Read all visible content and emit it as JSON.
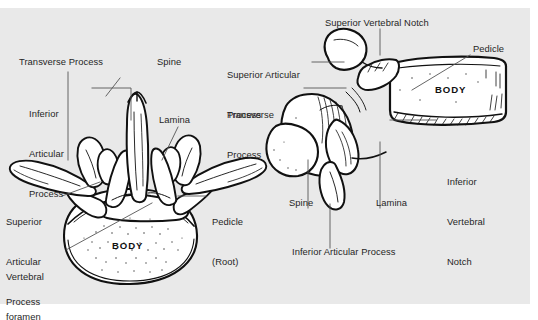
{
  "figure": {
    "background_color": "#e9e9e9",
    "ink_color": "#111111",
    "label_color": "#262626",
    "leader_color": "#555555"
  },
  "superior_view": {
    "body_label": "BODY",
    "labels": [
      {
        "id": "transverse-process",
        "text": "Transverse Process"
      },
      {
        "id": "inferior-articular-process-l1",
        "text": "Inferior"
      },
      {
        "id": "inferior-articular-process-l2",
        "text": "Articular"
      },
      {
        "id": "inferior-articular-process-l3",
        "text": "Process"
      },
      {
        "id": "spine",
        "text": "Spine"
      },
      {
        "id": "lamina",
        "text": "Lamina"
      },
      {
        "id": "superior-articular-process-l1",
        "text": "Superior"
      },
      {
        "id": "superior-articular-process-l2",
        "text": "Articular"
      },
      {
        "id": "superior-articular-process-l3",
        "text": "Process"
      },
      {
        "id": "pedicle-l1",
        "text": "Pedicle"
      },
      {
        "id": "pedicle-l2",
        "text": "(Root)"
      },
      {
        "id": "vertebral-foramen-l1",
        "text": "Vertebral"
      },
      {
        "id": "vertebral-foramen-l2",
        "text": "foramen"
      }
    ]
  },
  "lateral_view": {
    "body_label": "BODY",
    "labels": [
      {
        "id": "superior-vertebral-notch",
        "text": "Superior Vertebral Notch"
      },
      {
        "id": "superior-articular-process-l1",
        "text": "Superior Articular"
      },
      {
        "id": "superior-articular-process-l2",
        "text": "Process"
      },
      {
        "id": "pedicle",
        "text": "Pedicle"
      },
      {
        "id": "transverse-process-l1",
        "text": "Transverse"
      },
      {
        "id": "transverse-process-l2",
        "text": "Process"
      },
      {
        "id": "inferior-vertebral-notch-l1",
        "text": "Inferior"
      },
      {
        "id": "inferior-vertebral-notch-l2",
        "text": "Vertebral"
      },
      {
        "id": "inferior-vertebral-notch-l3",
        "text": "Notch"
      },
      {
        "id": "spine",
        "text": "Spine"
      },
      {
        "id": "lamina",
        "text": "Lamina"
      },
      {
        "id": "inferior-articular-process",
        "text": "Inferior Articular Process"
      }
    ]
  }
}
